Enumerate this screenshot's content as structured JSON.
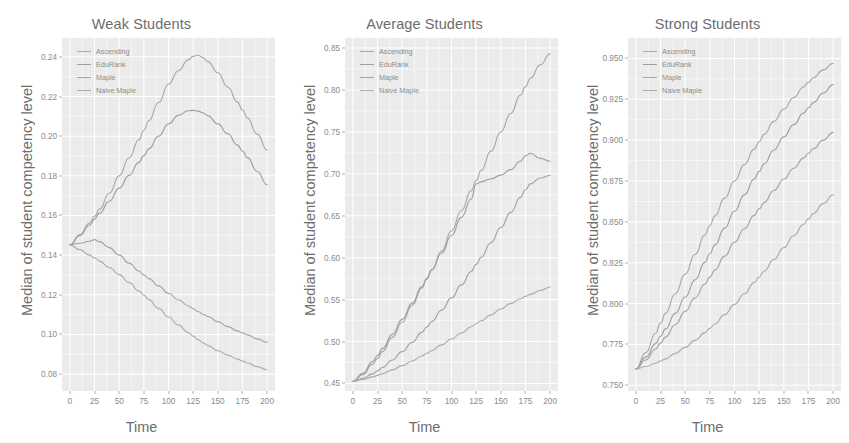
{
  "figure": {
    "xlabel": "Time",
    "ylabel": "Median of student competency level",
    "legend_labels": [
      "Ascending",
      "EduRank",
      "Maple",
      "Naive Maple"
    ],
    "series_colors": [
      "#a8a8a8",
      "#9e9e9e",
      "#a3a3a3",
      "#ababab"
    ],
    "panel_background": "#ebebeb",
    "grid_color": "#ffffff",
    "text_color": "#6d6d6d",
    "tick_color": "#8a8a8a"
  },
  "chart_data": [
    {
      "type": "line",
      "title": "Weak Students",
      "xlabel": "Time",
      "ylabel": "Median of student competency level",
      "xlim": [
        -8,
        208
      ],
      "ylim": [
        0.0715,
        0.2495
      ],
      "xticks": [
        0,
        25,
        50,
        75,
        100,
        125,
        150,
        175,
        200
      ],
      "xtick_labels": [
        "0",
        "25",
        "50",
        "75",
        "100",
        "125",
        "150",
        "175",
        "200"
      ],
      "yticks": [
        0.08,
        0.1,
        0.12,
        0.14,
        0.16,
        0.18,
        0.2,
        0.22,
        0.24
      ],
      "ytick_labels": [
        "0.08",
        "0.10",
        "0.12",
        "0.14",
        "0.16",
        "0.18",
        "0.20",
        "0.22",
        "0.24"
      ],
      "grid": true,
      "legend_position": "top-left",
      "x": [
        0,
        10,
        20,
        25,
        30,
        40,
        50,
        60,
        70,
        75,
        80,
        90,
        100,
        110,
        120,
        125,
        130,
        135,
        140,
        150,
        160,
        170,
        175,
        180,
        190,
        200
      ],
      "series": [
        {
          "name": "Ascending",
          "values": [
            0.1452,
            0.1502,
            0.1562,
            0.1596,
            0.1632,
            0.1712,
            0.18,
            0.189,
            0.1982,
            0.203,
            0.2078,
            0.217,
            0.2262,
            0.233,
            0.2385,
            0.2402,
            0.2408,
            0.2396,
            0.2375,
            0.232,
            0.2248,
            0.2172,
            0.2132,
            0.2092,
            0.201,
            0.193
          ]
        },
        {
          "name": "EduRank",
          "values": [
            0.1452,
            0.1498,
            0.1552,
            0.1582,
            0.1612,
            0.1672,
            0.1738,
            0.1802,
            0.1868,
            0.1902,
            0.1936,
            0.2,
            0.2062,
            0.2105,
            0.2128,
            0.213,
            0.2126,
            0.2118,
            0.2102,
            0.2062,
            0.2012,
            0.1955,
            0.1925,
            0.1892,
            0.1822,
            0.1755
          ]
        },
        {
          "name": "Maple",
          "values": [
            0.1452,
            0.146,
            0.147,
            0.1478,
            0.1468,
            0.1438,
            0.14,
            0.136,
            0.132,
            0.13,
            0.1282,
            0.1245,
            0.1208,
            0.1175,
            0.1145,
            0.113,
            0.1116,
            0.1102,
            0.109,
            0.1065,
            0.104,
            0.1018,
            0.1008,
            0.0998,
            0.0978,
            0.096
          ]
        },
        {
          "name": "Naive Maple",
          "values": [
            0.1452,
            0.1428,
            0.14,
            0.1386,
            0.137,
            0.1338,
            0.1302,
            0.1262,
            0.122,
            0.1198,
            0.1176,
            0.1132,
            0.1088,
            0.1048,
            0.101,
            0.0992,
            0.0974,
            0.0958,
            0.0944,
            0.0918,
            0.0896,
            0.0876,
            0.0866,
            0.0856,
            0.0838,
            0.0822
          ]
        }
      ]
    },
    {
      "type": "line",
      "title": "Average Students",
      "xlabel": "Time",
      "ylabel": "Median of student competency level",
      "xlim": [
        -8,
        208
      ],
      "ylim": [
        0.441,
        0.862
      ],
      "xticks": [
        0,
        25,
        50,
        75,
        100,
        125,
        150,
        175,
        200
      ],
      "xtick_labels": [
        "0",
        "25",
        "50",
        "75",
        "100",
        "125",
        "150",
        "175",
        "200"
      ],
      "yticks": [
        0.45,
        0.5,
        0.55,
        0.6,
        0.65,
        0.7,
        0.75,
        0.8,
        0.85
      ],
      "ytick_labels": [
        "0.45",
        "0.50",
        "0.55",
        "0.60",
        "0.65",
        "0.70",
        "0.75",
        "0.80",
        "0.85"
      ],
      "grid": true,
      "legend_position": "top-left",
      "x": [
        0,
        10,
        20,
        25,
        30,
        40,
        50,
        60,
        70,
        75,
        80,
        90,
        100,
        110,
        120,
        125,
        130,
        140,
        150,
        160,
        170,
        175,
        180,
        190,
        200
      ],
      "series": [
        {
          "name": "Ascending",
          "values": [
            0.4525,
            0.4605,
            0.473,
            0.48,
            0.488,
            0.505,
            0.523,
            0.543,
            0.564,
            0.5745,
            0.5855,
            0.608,
            0.632,
            0.656,
            0.68,
            0.692,
            0.704,
            0.727,
            0.75,
            0.772,
            0.794,
            0.804,
            0.814,
            0.83,
            0.843
          ]
        },
        {
          "name": "EduRank",
          "values": [
            0.4525,
            0.462,
            0.476,
            0.4835,
            0.4915,
            0.5085,
            0.5265,
            0.5455,
            0.5655,
            0.5755,
            0.5855,
            0.6055,
            0.6265,
            0.648,
            0.67,
            0.688,
            0.6905,
            0.694,
            0.6985,
            0.705,
            0.715,
            0.7215,
            0.7245,
            0.7185,
            0.715
          ]
        },
        {
          "name": "Maple",
          "values": [
            0.4525,
            0.456,
            0.4615,
            0.465,
            0.469,
            0.478,
            0.488,
            0.499,
            0.511,
            0.5175,
            0.524,
            0.5375,
            0.552,
            0.5675,
            0.5835,
            0.592,
            0.6005,
            0.618,
            0.636,
            0.654,
            0.672,
            0.681,
            0.688,
            0.695,
            0.698
          ]
        },
        {
          "name": "Naive Maple",
          "values": [
            0.4525,
            0.4548,
            0.4578,
            0.4596,
            0.4616,
            0.4662,
            0.4712,
            0.4768,
            0.4828,
            0.486,
            0.4892,
            0.496,
            0.503,
            0.5102,
            0.5176,
            0.5212,
            0.5248,
            0.5318,
            0.5388,
            0.5452,
            0.551,
            0.5538,
            0.5562,
            0.5608,
            0.565
          ]
        }
      ]
    },
    {
      "type": "line",
      "title": "Strong Students",
      "xlabel": "Time",
      "ylabel": "Median of student competency level",
      "xlim": [
        -8,
        208
      ],
      "ylim": [
        0.7465,
        0.9625
      ],
      "xticks": [
        0,
        25,
        50,
        75,
        100,
        125,
        150,
        175,
        200
      ],
      "xtick_labels": [
        "0",
        "25",
        "50",
        "75",
        "100",
        "125",
        "150",
        "175",
        "200"
      ],
      "yticks": [
        0.75,
        0.775,
        0.8,
        0.825,
        0.85,
        0.875,
        0.9,
        0.925,
        0.95
      ],
      "ytick_labels": [
        "0.750",
        "0.775",
        "0.800",
        "0.825",
        "0.850",
        "0.875",
        "0.900",
        "0.925",
        "0.950"
      ],
      "grid": true,
      "legend_position": "top-left",
      "x": [
        0,
        10,
        20,
        25,
        30,
        40,
        50,
        60,
        70,
        75,
        80,
        90,
        100,
        110,
        120,
        125,
        130,
        140,
        150,
        160,
        170,
        175,
        180,
        190,
        200
      ],
      "series": [
        {
          "name": "Ascending",
          "values": [
            0.76,
            0.77,
            0.782,
            0.788,
            0.794,
            0.806,
            0.818,
            0.83,
            0.842,
            0.8478,
            0.8535,
            0.8645,
            0.875,
            0.885,
            0.8945,
            0.899,
            0.9035,
            0.9115,
            0.919,
            0.926,
            0.9325,
            0.9355,
            0.9382,
            0.943,
            0.947
          ]
        },
        {
          "name": "EduRank",
          "values": [
            0.76,
            0.7672,
            0.7755,
            0.78,
            0.7845,
            0.794,
            0.804,
            0.8145,
            0.8252,
            0.8305,
            0.8358,
            0.8462,
            0.8565,
            0.8665,
            0.8762,
            0.8808,
            0.8855,
            0.894,
            0.902,
            0.9095,
            0.9165,
            0.9198,
            0.923,
            0.9288,
            0.934
          ]
        },
        {
          "name": "Maple",
          "values": [
            0.76,
            0.7655,
            0.7722,
            0.7758,
            0.7795,
            0.7872,
            0.7952,
            0.8035,
            0.812,
            0.8162,
            0.8205,
            0.829,
            0.8375,
            0.8458,
            0.854,
            0.858,
            0.8618,
            0.8692,
            0.8762,
            0.8828,
            0.889,
            0.892,
            0.8948,
            0.9,
            0.9048
          ]
        },
        {
          "name": "Naive Maple",
          "values": [
            0.76,
            0.7615,
            0.7635,
            0.7648,
            0.7662,
            0.7695,
            0.7732,
            0.7775,
            0.7822,
            0.7848,
            0.7875,
            0.7932,
            0.7995,
            0.806,
            0.8128,
            0.8162,
            0.8198,
            0.827,
            0.8342,
            0.8415,
            0.8485,
            0.8518,
            0.855,
            0.8612,
            0.8665
          ]
        }
      ]
    }
  ]
}
